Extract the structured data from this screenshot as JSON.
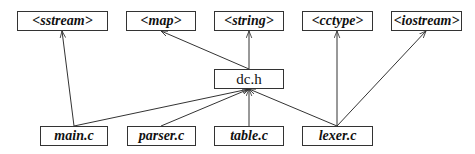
{
  "diagram": {
    "type": "dependency-graph",
    "nodes": [
      {
        "id": "sstream",
        "label": "<sstream>",
        "x": 17,
        "y": 11,
        "w": 91,
        "h": 20,
        "style": "italic"
      },
      {
        "id": "map",
        "label": "<map>",
        "x": 126,
        "y": 11,
        "w": 70,
        "h": 20,
        "style": "italic"
      },
      {
        "id": "string",
        "label": "<string>",
        "x": 214,
        "y": 11,
        "w": 70,
        "h": 20,
        "style": "italic"
      },
      {
        "id": "cctype",
        "label": "<cctype>",
        "x": 302,
        "y": 11,
        "w": 71,
        "h": 20,
        "style": "italic"
      },
      {
        "id": "iostream",
        "label": "<iostream>",
        "x": 391,
        "y": 11,
        "w": 71,
        "h": 20,
        "style": "italic"
      },
      {
        "id": "dch",
        "label": "dc.h",
        "x": 214,
        "y": 69,
        "w": 70,
        "h": 20,
        "style": "upright"
      },
      {
        "id": "mainc",
        "label": "main.c",
        "x": 40,
        "y": 126,
        "w": 68,
        "h": 20,
        "style": "italic"
      },
      {
        "id": "parserc",
        "label": "parser.c",
        "x": 127,
        "y": 126,
        "w": 69,
        "h": 20,
        "style": "italic"
      },
      {
        "id": "tablec",
        "label": "table.c",
        "x": 214,
        "y": 126,
        "w": 70,
        "h": 20,
        "style": "italic"
      },
      {
        "id": "lexerc",
        "label": "lexer.c",
        "x": 302,
        "y": 126,
        "w": 71,
        "h": 20,
        "style": "italic"
      }
    ],
    "edges": [
      {
        "from": "mainc",
        "to": "sstream",
        "x1": 74,
        "y1": 126,
        "x2": 62,
        "y2": 31
      },
      {
        "from": "mainc",
        "to": "dch",
        "x1": 74,
        "y1": 126,
        "x2": 249,
        "y2": 89
      },
      {
        "from": "parserc",
        "to": "dch",
        "x1": 161,
        "y1": 126,
        "x2": 249,
        "y2": 89
      },
      {
        "from": "tablec",
        "to": "dch",
        "x1": 249,
        "y1": 126,
        "x2": 249,
        "y2": 89
      },
      {
        "from": "lexerc",
        "to": "dch",
        "x1": 337,
        "y1": 126,
        "x2": 249,
        "y2": 89
      },
      {
        "from": "lexerc",
        "to": "cctype",
        "x1": 337,
        "y1": 126,
        "x2": 337,
        "y2": 31
      },
      {
        "from": "lexerc",
        "to": "iostream",
        "x1": 337,
        "y1": 126,
        "x2": 426,
        "y2": 31
      },
      {
        "from": "dch",
        "to": "map",
        "x1": 249,
        "y1": 69,
        "x2": 161,
        "y2": 31
      },
      {
        "from": "dch",
        "to": "string",
        "x1": 249,
        "y1": 69,
        "x2": 249,
        "y2": 31
      }
    ],
    "colors": {
      "line": "#333333",
      "box_border": "#333333",
      "text": "#111111",
      "background": "#ffffff"
    }
  }
}
